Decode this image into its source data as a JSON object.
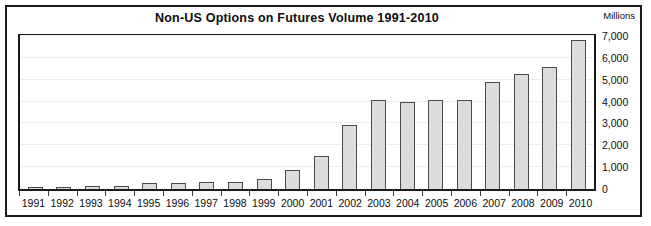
{
  "header": {
    "title": "Non-US Options on Futures Volume 1991-2010",
    "unit_label": "Millions"
  },
  "colors": {
    "bar_fill": "#dcdcdc",
    "bar_border": "#4a4a4a",
    "frame": "#1a1a1a",
    "gridline": "#ededed",
    "text": "#0d0d0d",
    "background": "#ffffff"
  },
  "chart_data": {
    "type": "bar",
    "title": "Non-US Options on Futures Volume 1991-2010",
    "xlabel": "",
    "ylabel": "Millions",
    "ylim": [
      0,
      7000
    ],
    "yticks": [
      0,
      1000,
      2000,
      3000,
      4000,
      5000,
      6000,
      7000
    ],
    "ytick_labels": [
      "0",
      "1,000",
      "2,000",
      "3,000",
      "4,000",
      "5,000",
      "6,000",
      "7,000"
    ],
    "grid": true,
    "legend": null,
    "categories": [
      "1991",
      "1992",
      "1993",
      "1994",
      "1995",
      "1996",
      "1997",
      "1998",
      "1999",
      "2000",
      "2001",
      "2002",
      "2003",
      "2004",
      "2005",
      "2006",
      "2007",
      "2008",
      "2009",
      "2010"
    ],
    "values": [
      100,
      110,
      120,
      160,
      280,
      290,
      330,
      330,
      480,
      850,
      1500,
      2950,
      4050,
      3980,
      4080,
      4080,
      4900,
      5250,
      5600,
      6800
    ]
  }
}
